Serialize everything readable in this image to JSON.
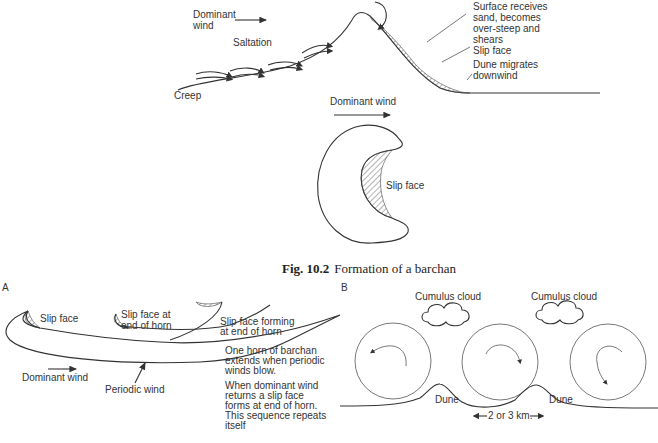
{
  "figure": {
    "caption_number": "Fig. 10.2",
    "caption_text": "Formation of a barchan"
  },
  "profile": {
    "dominant_wind": "Dominant",
    "dominant_wind_2": "wind",
    "saltation": "Saltation",
    "creep": "Creep",
    "surface_note": [
      "Surface receives",
      "sand, becomes",
      "over-steep and",
      "shears"
    ],
    "slip_face": "Slip face",
    "migrates": [
      "Dune migrates",
      "downwind"
    ]
  },
  "plan": {
    "dominant_wind": "Dominant wind",
    "slip_face": "Slip face"
  },
  "panel_a": {
    "label": "A",
    "slip_face": "Slip face",
    "slip_face_horn": [
      "Slip face at",
      "end of horn"
    ],
    "slip_face_forming": [
      "Slip face forming",
      "at end of horn"
    ],
    "dominant_wind": "Dominant wind",
    "periodic_wind": "Periodic wind",
    "note1": [
      "One horn of barchan",
      "extends when periodic",
      "winds blow."
    ],
    "note2": [
      "When dominant wind",
      "returns a slip face",
      "forms at end of horn.",
      "This sequence repeats",
      "itself"
    ]
  },
  "panel_b": {
    "label": "B",
    "cloud1": "Cumulus cloud",
    "cloud2": "Cumulus cloud",
    "dune1": "Dune",
    "dune2": "Dune",
    "distance": "2 or 3 km."
  }
}
